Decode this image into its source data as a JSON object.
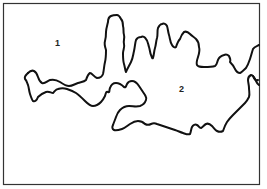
{
  "figure": {
    "type": "region-outline-diagram",
    "frame": {
      "x": 3,
      "y": 3,
      "width": 257,
      "height": 182
    },
    "stroke_color": "#111111",
    "frame_color": "#333333",
    "background": "#ffffff",
    "regions": [
      {
        "id": "region-1",
        "label": "1",
        "x": 55,
        "y": 39
      },
      {
        "id": "region-2",
        "label": "2",
        "x": 179,
        "y": 85
      }
    ]
  }
}
